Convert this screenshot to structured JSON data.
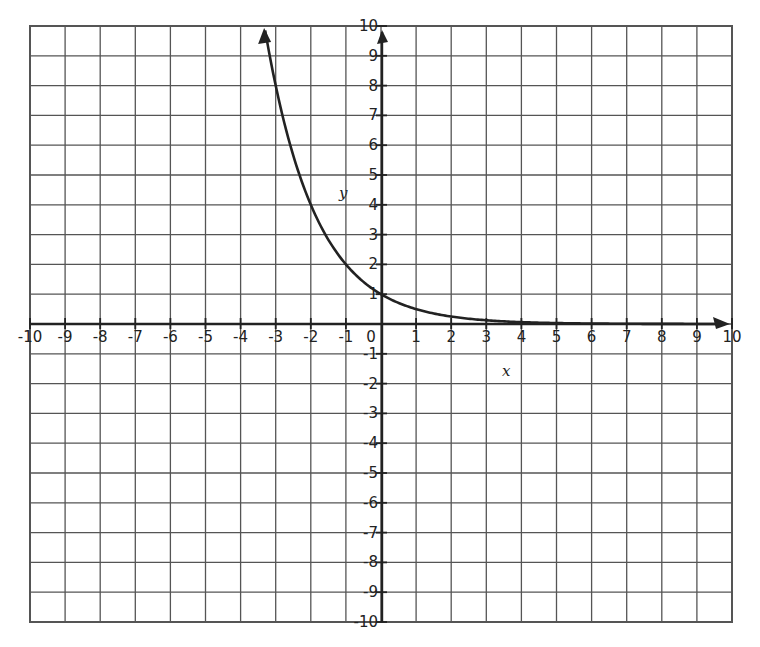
{
  "chart_data": {
    "type": "line",
    "title": "",
    "xlabel": "x",
    "ylabel": "y",
    "xlim": [
      -10,
      10
    ],
    "ylim": [
      -10,
      10
    ],
    "grid": true,
    "x_ticks": [
      -10,
      -9,
      -8,
      -7,
      -6,
      -5,
      -4,
      -3,
      -2,
      -1,
      0,
      1,
      2,
      3,
      4,
      5,
      6,
      7,
      8,
      9,
      10
    ],
    "y_ticks": [
      -10,
      -9,
      -8,
      -7,
      -6,
      -5,
      -4,
      -3,
      -2,
      -1,
      1,
      2,
      3,
      4,
      5,
      6,
      7,
      8,
      9,
      10
    ],
    "x_tick_labels": [
      "-10",
      "-9",
      "-8",
      "-7",
      "-6",
      "-5",
      "-4",
      "-3",
      "-2",
      "-1",
      "0",
      "1",
      "2",
      "3",
      "4",
      "5",
      "6",
      "7",
      "8",
      "9",
      "10"
    ],
    "y_tick_labels": [
      "-10",
      "-9",
      "-8",
      "-7",
      "-6",
      "-5",
      "-4",
      "-3",
      "-2",
      "-1",
      "1",
      "2",
      "3",
      "4",
      "5",
      "6",
      "7",
      "8",
      "9",
      "10"
    ],
    "series": [
      {
        "name": "y = (1/2)^x",
        "x": [
          -3.3,
          -3,
          -2,
          -1,
          0,
          1,
          2,
          3,
          4,
          5,
          6,
          7,
          8,
          9,
          9.8
        ],
        "values": [
          9.85,
          8,
          4,
          2,
          1,
          0.5,
          0.25,
          0.125,
          0.0625,
          0.03125,
          0.0156,
          0.0078,
          0.0039,
          0.002,
          0.0011
        ],
        "arrow_ends": true
      }
    ],
    "key_points": [
      {
        "x": -3,
        "y": 8
      },
      {
        "x": -2,
        "y": 4
      },
      {
        "x": -1,
        "y": 2
      },
      {
        "x": 0,
        "y": 1
      }
    ],
    "legend": null
  },
  "colors": {
    "grid": "#555555",
    "axis": "#222222",
    "curve": "#222222",
    "background": "#ffffff"
  }
}
